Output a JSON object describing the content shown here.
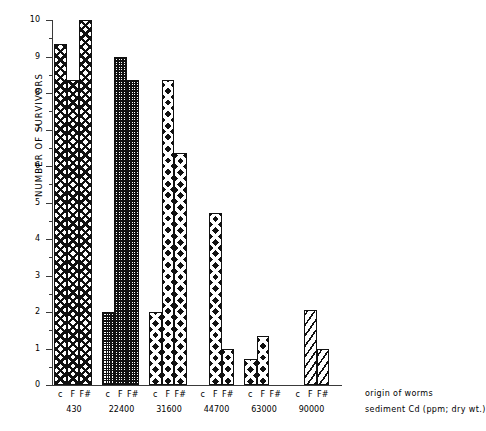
{
  "chart_data": {
    "type": "bar",
    "title": "",
    "ylabel": "NUMBER OF SURVIVORS",
    "xlabel": "",
    "ylim": [
      0,
      10
    ],
    "ytick_labels": [
      "0",
      "1",
      "2",
      "3",
      "4",
      "5",
      "6",
      "7",
      "8",
      "9",
      "10"
    ],
    "ytick_values": [
      0,
      1,
      2,
      3,
      4,
      5,
      6,
      7,
      8,
      9,
      10
    ],
    "grid": false,
    "legend": "none",
    "subcategories": [
      "c",
      "F",
      "F#"
    ],
    "categories": [
      "430",
      "22400",
      "31600",
      "44700",
      "63000",
      "90000"
    ],
    "group_axis_label": "sediment Cd (ppm; dry wt.)",
    "subcategory_axis_label": "origin of worms",
    "series": [
      {
        "name": "c",
        "values": [
          9.35,
          2.0,
          2.0,
          0.0,
          0.7,
          0.0
        ],
        "fill": "diamond"
      },
      {
        "name": "F",
        "values": [
          8.35,
          9.0,
          8.35,
          4.7,
          1.35,
          2.05
        ],
        "fill": "dot"
      },
      {
        "name": "F#",
        "values": [
          10.0,
          8.35,
          6.35,
          1.0,
          0.0,
          1.0
        ],
        "fill": "bigdiamond"
      }
    ],
    "group_fills": [
      "diamond",
      "dot",
      "bigdiamond",
      "bigdiamond",
      "bigdiamond",
      "diag"
    ],
    "bars": [
      {
        "group": "430",
        "sub": "c",
        "value": 9.35,
        "fill": "diamond"
      },
      {
        "group": "430",
        "sub": "F",
        "value": 8.35,
        "fill": "diamond"
      },
      {
        "group": "430",
        "sub": "F#",
        "value": 10.0,
        "fill": "diamond"
      },
      {
        "group": "22400",
        "sub": "c",
        "value": 2.0,
        "fill": "dot"
      },
      {
        "group": "22400",
        "sub": "F",
        "value": 9.0,
        "fill": "dot"
      },
      {
        "group": "22400",
        "sub": "F#",
        "value": 8.35,
        "fill": "dot"
      },
      {
        "group": "31600",
        "sub": "c",
        "value": 2.0,
        "fill": "bigdiamond"
      },
      {
        "group": "31600",
        "sub": "F",
        "value": 8.35,
        "fill": "bigdiamond"
      },
      {
        "group": "31600",
        "sub": "F#",
        "value": 6.35,
        "fill": "bigdiamond"
      },
      {
        "group": "44700",
        "sub": "c",
        "value": 0.0,
        "fill": "bigdiamond"
      },
      {
        "group": "44700",
        "sub": "F",
        "value": 4.7,
        "fill": "bigdiamond"
      },
      {
        "group": "44700",
        "sub": "F#",
        "value": 1.0,
        "fill": "bigdiamond"
      },
      {
        "group": "63000",
        "sub": "c",
        "value": 0.7,
        "fill": "bigdiamond"
      },
      {
        "group": "63000",
        "sub": "F",
        "value": 1.35,
        "fill": "bigdiamond"
      },
      {
        "group": "63000",
        "sub": "F#",
        "value": 0.0,
        "fill": "bigdiamond"
      },
      {
        "group": "90000",
        "sub": "c",
        "value": 0.0,
        "fill": "diag"
      },
      {
        "group": "90000",
        "sub": "F",
        "value": 2.05,
        "fill": "diag"
      },
      {
        "group": "90000",
        "sub": "F#",
        "value": 1.0,
        "fill": "diag"
      }
    ]
  },
  "axes": {
    "y_title": "NUMBER OF SURVIVORS",
    "origin_note": "origin of worms",
    "sediment_note": "sediment Cd (ppm; dry wt.)"
  },
  "xcat_text": "c  F  F#"
}
